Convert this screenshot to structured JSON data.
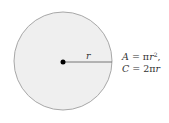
{
  "diagram": {
    "circle": {
      "cx": 63,
      "cy": 61,
      "r": 49,
      "fill": "#efefef",
      "stroke": "#a8a8a8"
    },
    "center_dot": {
      "cx": 63,
      "cy": 62,
      "r": 2.5,
      "fill": "#000000"
    },
    "radius_line": {
      "x1": 63,
      "y1": 62,
      "x2": 112,
      "y2": 62,
      "stroke": "#777777"
    },
    "radius_label": "r",
    "formulas": {
      "area": {
        "lhs": "A",
        "eq": " = π",
        "var": "r",
        "exp": "2",
        "tail": ","
      },
      "circumference": {
        "lhs": "C",
        "eq": " = 2π",
        "var": "r"
      }
    }
  }
}
